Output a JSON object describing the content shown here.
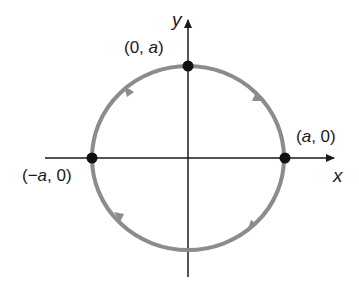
{
  "diagram": {
    "type": "parametric-circle-orientation",
    "axes": {
      "x_label": "x",
      "y_label": "y"
    },
    "points": [
      {
        "id": "top",
        "label_open": "(0, ",
        "label_var": "a",
        "label_close": ")"
      },
      {
        "id": "right",
        "label_open": "(",
        "label_var": "a",
        "label_close": ", 0)"
      },
      {
        "id": "left",
        "label_open": "(−",
        "label_var": "a",
        "label_close": ", 0)"
      }
    ],
    "direction": "counterclockwise",
    "colors": {
      "circle": "#8c8c8c",
      "axes": "#1a1a1a",
      "points": "#111111",
      "background": "#ffffff"
    }
  }
}
